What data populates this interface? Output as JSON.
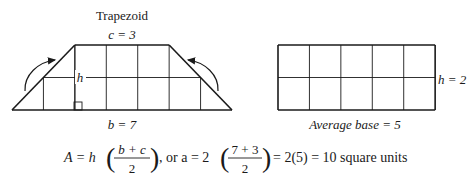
{
  "trapezoid": {
    "title": "Trapezoid",
    "top_label": "c = 3",
    "bottom_label": "b = 7",
    "height_label": "h",
    "top_units": 3,
    "bottom_units": 7,
    "height_units": 2
  },
  "rectangle": {
    "height_label": "h = 2",
    "base_label": "Average base = 5",
    "width_units": 5,
    "height_units": 2
  },
  "formula": {
    "lhs": "A = h",
    "frac1_num": "b + c",
    "frac1_den": "2",
    "connector": ", or a = 2",
    "frac2_num": "7 + 3",
    "frac2_den": "2",
    "result": "= 2(5) = 10 square units"
  }
}
